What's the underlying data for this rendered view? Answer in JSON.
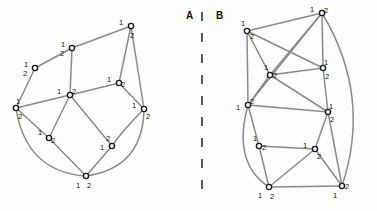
{
  "figure": {
    "background_color": "#fdfdfd",
    "edge_color": "#8a8a8a",
    "node_stroke_color": "#1a1a1a",
    "node_fill_color": "#ffffff",
    "label_color": "#121212",
    "divider_color": "#303030",
    "width": 377,
    "height": 211
  },
  "panels": [
    {
      "id": "A",
      "label": "A",
      "label_x": 186,
      "label_y": 10
    },
    {
      "id": "B",
      "label": "B",
      "label_x": 216,
      "label_y": 10
    }
  ],
  "divider": {
    "name": "panel-divider",
    "x": 202,
    "y_start": 12,
    "y_end": 200,
    "dash_length": 9,
    "gap_length": 12
  },
  "graph_a": {
    "name": "graph-a",
    "nodes": [
      {
        "id": "a1",
        "x": 131,
        "y": 26,
        "labels": [
          {
            "text": "1",
            "dx": -10,
            "dy": -3
          },
          {
            "text": "2",
            "dy": 10,
            "dx": 1
          }
        ]
      },
      {
        "id": "a2",
        "x": 72,
        "y": 48,
        "labels": [
          {
            "text": "1",
            "dx": -9,
            "dy": -3
          },
          {
            "text": "2",
            "dx": -10,
            "dy": 6
          }
        ]
      },
      {
        "id": "a3",
        "x": 35,
        "y": 68,
        "labels": [
          {
            "text": "1",
            "dx": -9,
            "dy": -3
          },
          {
            "text": "2",
            "dx": -10,
            "dy": 6
          }
        ]
      },
      {
        "id": "a4",
        "x": 70,
        "y": 95,
        "labels": [
          {
            "text": "1",
            "dx": -11,
            "dy": -3
          },
          {
            "text": "2",
            "dx": 4,
            "dy": -3
          }
        ]
      },
      {
        "id": "a5",
        "x": 119,
        "y": 83,
        "labels": [
          {
            "text": "1",
            "dx": -10,
            "dy": -3
          },
          {
            "text": "2",
            "dx": 4,
            "dy": 2
          }
        ]
      },
      {
        "id": "a6",
        "x": 16,
        "y": 108,
        "labels": [
          {
            "text": "1",
            "dx": 2,
            "dy": -6
          },
          {
            "text": "2",
            "dx": 4,
            "dy": 9
          }
        ]
      },
      {
        "id": "a7",
        "x": 144,
        "y": 109,
        "labels": [
          {
            "text": "1",
            "dx": -10,
            "dy": -3
          },
          {
            "text": "2",
            "dx": 4,
            "dy": 8
          }
        ]
      },
      {
        "id": "a8",
        "x": 49,
        "y": 138,
        "labels": [
          {
            "text": "1",
            "dx": -9,
            "dy": -5
          },
          {
            "text": "2",
            "dx": 4,
            "dy": 3
          }
        ]
      },
      {
        "id": "a9",
        "x": 112,
        "y": 146,
        "labels": [
          {
            "text": "1",
            "dx": -10,
            "dy": 2
          },
          {
            "text": "2",
            "dx": -4,
            "dy": -7
          }
        ]
      },
      {
        "id": "a10",
        "x": 86,
        "y": 176,
        "labels": [
          {
            "text": "1",
            "dx": -8,
            "dy": 10
          },
          {
            "text": "2",
            "dx": 3,
            "dy": 10
          }
        ]
      }
    ],
    "edges": [
      {
        "from": "a1",
        "to": "a2",
        "kind": "line"
      },
      {
        "from": "a2",
        "to": "a3",
        "kind": "line"
      },
      {
        "from": "a3",
        "to": "a6",
        "kind": "line"
      },
      {
        "from": "a2",
        "to": "a4",
        "kind": "line"
      },
      {
        "from": "a1",
        "to": "a5",
        "kind": "line"
      },
      {
        "from": "a1",
        "to": "a7",
        "kind": "line"
      },
      {
        "from": "a5",
        "to": "a4",
        "kind": "line"
      },
      {
        "from": "a5",
        "to": "a7",
        "kind": "line"
      },
      {
        "from": "a4",
        "to": "a6",
        "kind": "line"
      },
      {
        "from": "a4",
        "to": "a8",
        "kind": "line"
      },
      {
        "from": "a4",
        "to": "a9",
        "kind": "line"
      },
      {
        "from": "a6",
        "to": "a8",
        "kind": "line"
      },
      {
        "from": "a8",
        "to": "a10",
        "kind": "line"
      },
      {
        "from": "a9",
        "to": "a10",
        "kind": "line"
      },
      {
        "from": "a7",
        "to": "a9",
        "kind": "curve",
        "cx": 122,
        "cy": 131
      },
      {
        "from": "a6",
        "to": "a10",
        "kind": "curve",
        "cx": 26,
        "cy": 172
      },
      {
        "from": "a7",
        "to": "a10",
        "kind": "curve",
        "cx": 143,
        "cy": 168
      }
    ]
  },
  "graph_b": {
    "name": "graph-b",
    "nodes": [
      {
        "id": "b1",
        "x": 322,
        "y": 13,
        "labels": [
          {
            "text": "1",
            "dx": -10,
            "dy": -3
          },
          {
            "text": "2",
            "dx": 4,
            "dy": -2
          }
        ]
      },
      {
        "id": "b2",
        "x": 247,
        "y": 31,
        "labels": [
          {
            "text": "1",
            "dx": -4,
            "dy": -7
          },
          {
            "text": "2",
            "dx": 5,
            "dy": 6
          }
        ]
      },
      {
        "id": "b3",
        "x": 323,
        "y": 68,
        "labels": [
          {
            "text": "1",
            "dx": 3,
            "dy": -5
          },
          {
            "text": "2",
            "dx": 4,
            "dy": 9
          }
        ]
      },
      {
        "id": "b4",
        "x": 270,
        "y": 75,
        "labels": [
          {
            "text": "1",
            "dx": -4,
            "dy": -7
          },
          {
            "text": "2",
            "dx": 5,
            "dy": 1
          }
        ]
      },
      {
        "id": "b5",
        "x": 248,
        "y": 105,
        "labels": [
          {
            "text": "1",
            "dx": -10,
            "dy": 3
          },
          {
            "text": "2",
            "dx": 4,
            "dy": -3
          }
        ]
      },
      {
        "id": "b6",
        "x": 328,
        "y": 112,
        "labels": [
          {
            "text": "1",
            "dx": 3,
            "dy": -5
          },
          {
            "text": "2",
            "dx": 4,
            "dy": 8
          }
        ]
      },
      {
        "id": "b7",
        "x": 259,
        "y": 146,
        "labels": [
          {
            "text": "1",
            "dx": -4,
            "dy": -7
          },
          {
            "text": "2",
            "dx": 5,
            "dy": 2
          }
        ]
      },
      {
        "id": "b8",
        "x": 315,
        "y": 149,
        "labels": [
          {
            "text": "1",
            "dx": -10,
            "dy": -3
          },
          {
            "text": "2",
            "dx": 4,
            "dy": 8
          }
        ]
      },
      {
        "id": "b9",
        "x": 269,
        "y": 187,
        "labels": [
          {
            "text": "1",
            "dx": -9,
            "dy": 9
          },
          {
            "text": "2",
            "dx": 3,
            "dy": 10
          }
        ]
      },
      {
        "id": "b10",
        "x": 342,
        "y": 186,
        "labels": [
          {
            "text": "1",
            "dx": -7,
            "dy": 10
          },
          {
            "text": "2",
            "dx": 5,
            "dy": 1
          }
        ]
      }
    ],
    "edges": [
      {
        "from": "b1",
        "to": "b2",
        "kind": "line"
      },
      {
        "from": "b1",
        "to": "b3",
        "kind": "line"
      },
      {
        "from": "b1",
        "to": "b4",
        "kind": "line"
      },
      {
        "from": "b1",
        "to": "b5",
        "kind": "line"
      },
      {
        "from": "b2",
        "to": "b4",
        "kind": "line"
      },
      {
        "from": "b2",
        "to": "b5",
        "kind": "line"
      },
      {
        "from": "b2",
        "to": "b3",
        "kind": "line"
      },
      {
        "from": "b3",
        "to": "b4",
        "kind": "line"
      },
      {
        "from": "b3",
        "to": "b6",
        "kind": "line"
      },
      {
        "from": "b4",
        "to": "b5",
        "kind": "line"
      },
      {
        "from": "b4",
        "to": "b6",
        "kind": "line"
      },
      {
        "from": "b5",
        "to": "b6",
        "kind": "line"
      },
      {
        "from": "b5",
        "to": "b7",
        "kind": "line"
      },
      {
        "from": "b6",
        "to": "b8",
        "kind": "line"
      },
      {
        "from": "b6",
        "to": "b10",
        "kind": "line"
      },
      {
        "from": "b7",
        "to": "b8",
        "kind": "line"
      },
      {
        "from": "b7",
        "to": "b9",
        "kind": "line"
      },
      {
        "from": "b8",
        "to": "b9",
        "kind": "line"
      },
      {
        "from": "b8",
        "to": "b10",
        "kind": "line"
      },
      {
        "from": "b9",
        "to": "b10",
        "kind": "line"
      },
      {
        "from": "b5",
        "to": "b9",
        "kind": "curve",
        "cx": 232,
        "cy": 163
      },
      {
        "from": "b1",
        "to": "b10",
        "kind": "curve",
        "cx": 372,
        "cy": 96
      }
    ]
  }
}
